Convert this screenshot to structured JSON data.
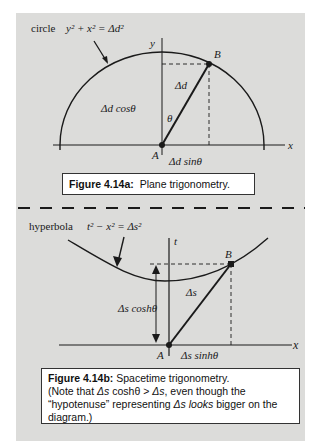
{
  "figure_a": {
    "curve_label": "circle",
    "equation": "y² + x² = Δd²",
    "axis_y": "y",
    "axis_x": "x",
    "point_a": "A",
    "point_b": "B",
    "hypotenuse": "Δd",
    "angle": "θ",
    "vertical_leg": "Δd cosθ",
    "horizontal_leg": "Δd sinθ",
    "caption_label": "Figure 4.14a:",
    "caption_text": "Plane trigonometry."
  },
  "figure_b": {
    "curve_label": "hyperbola",
    "equation": "t² − x² = Δs²",
    "axis_t": "t",
    "axis_x": "x",
    "point_a": "A",
    "point_b": "B",
    "hypotenuse": "Δs",
    "vertical_leg": "Δs coshθ",
    "horizontal_leg": "Δs sinhθ",
    "caption_label": "Figure 4.14b:",
    "caption_text_1": "Spacetime trigonometry.",
    "caption_text_2": "(Note that ",
    "caption_expr_1": "Δs",
    "caption_text_3": " coshθ > ",
    "caption_expr_2": "Δs",
    "caption_text_4": ", even though the “hypotenuse” representing ",
    "caption_expr_3": "Δs looks",
    "caption_text_5": " bigger on the diagram.)"
  },
  "colors": {
    "panel_background": "#dcdcda",
    "ink": "#1a1a1a",
    "caption_background": "#ffffff"
  }
}
